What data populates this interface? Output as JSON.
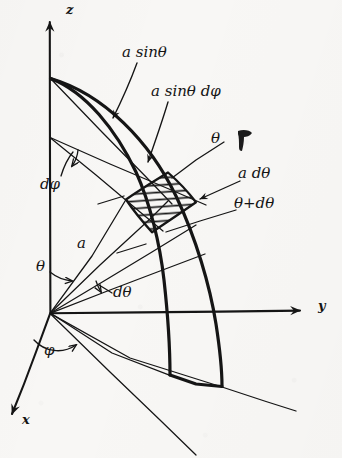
{
  "figure": {
    "kind": "hand-drawn physics diagram",
    "background_color": "#f8f7f5",
    "ink_color": "#141414"
  },
  "axes": [
    {
      "name": "z-axis",
      "label": "z",
      "direction": "up",
      "arrow": true
    },
    {
      "name": "y-axis",
      "label": "y",
      "direction": "right",
      "arrow": true
    },
    {
      "name": "x-axis",
      "label": "x",
      "direction": "down-left",
      "arrow": true
    }
  ],
  "labels": {
    "z": "z",
    "y": "y",
    "x": "x",
    "a_sin_theta": "a sinθ",
    "a_sin_theta_dphi": "a sinθ dφ",
    "theta_top": "θ",
    "a_dtheta": "a dθ",
    "theta_plus_dtheta": "θ+dθ",
    "dphi": "dφ",
    "radius_a": "a",
    "theta_left": "θ",
    "dtheta": "dθ",
    "phi": "φ",
    "ink_smudge": ""
  },
  "annotations": [
    {
      "name": "a-sin-theta",
      "text": "a sinθ",
      "points_to": "parallel-circle-radius"
    },
    {
      "name": "a-sin-theta-dphi",
      "text": "a sinθ dφ",
      "points_to": "patch-top-edge-arc-length"
    },
    {
      "name": "theta",
      "text": "θ",
      "points_to": "upper-radial-line"
    },
    {
      "name": "a-dtheta",
      "text": "a dθ",
      "points_to": "patch-right-meridian-edge"
    },
    {
      "name": "theta-plus-dtheta",
      "text": "θ+dθ",
      "points_to": "lower-radial-line"
    },
    {
      "name": "dphi",
      "text": "dφ",
      "points_to": "azimuthal-angle-arc"
    },
    {
      "name": "radius-a",
      "text": "a",
      "points_to": "radius-line-from-origin"
    },
    {
      "name": "theta-origin",
      "text": "θ",
      "points_to": "polar-angle-arc-at-origin"
    },
    {
      "name": "dtheta",
      "text": "dθ",
      "points_to": "polar-angle-increment-arc"
    },
    {
      "name": "phi",
      "text": "φ",
      "points_to": "azimuth-angle-arc-below-origin"
    }
  ],
  "geometry": {
    "origin": {
      "x": 50,
      "y": 313
    },
    "pole": {
      "x": 50,
      "y": 78
    },
    "hatched_patch_name": "surface-element-dA",
    "hatch_direction": "horizontal",
    "meridian_arcs": 2,
    "shaded_patch_vertices": [
      {
        "x": 126,
        "y": 199
      },
      {
        "x": 168,
        "y": 172
      },
      {
        "x": 196,
        "y": 202
      },
      {
        "x": 152,
        "y": 232
      }
    ]
  }
}
